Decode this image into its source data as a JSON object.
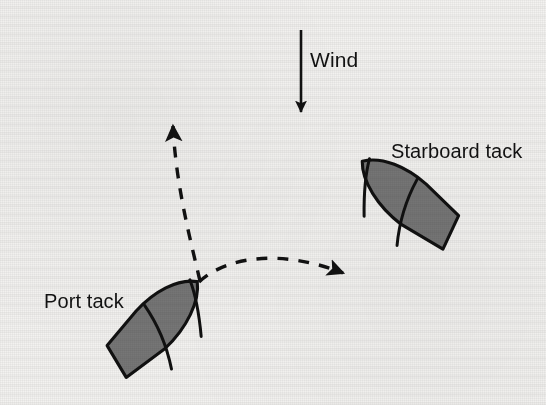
{
  "figure": {
    "background_color": "#f3f2f0",
    "ink_color": "#121212",
    "hull_fill_color": "#767676",
    "hull_outline_color": "#111111"
  },
  "labels": {
    "wind": "Wind",
    "starboard_tack": "Starboard tack",
    "port_tack": "Port tack"
  },
  "wind_arrow": {
    "direction": "down",
    "shaft_x": 301,
    "start_y": 30,
    "tip_y": 114
  },
  "boats": [
    {
      "name": "starboard-tack-boat",
      "label": "Starboard tack",
      "bow_x": 363,
      "bow_y": 164,
      "stern_x": 456,
      "stern_y": 239,
      "heading_deg": 39
    },
    {
      "name": "port-tack-boat",
      "label": "Port tack",
      "bow_x": 197,
      "bow_y": 283,
      "stern_x": 112,
      "stern_y": 369,
      "heading_deg": 135
    }
  ],
  "tack_paths": [
    {
      "name": "port-tack-heading-path",
      "style": "dashed",
      "start_x": 200,
      "start_y": 278,
      "end_x": 172,
      "end_y": 118,
      "arrowhead": "up-left"
    },
    {
      "name": "starboard-tack-heading-path",
      "style": "dashed",
      "start_x": 200,
      "start_y": 278,
      "end_x": 353,
      "end_y": 280,
      "arrowhead": "down-right"
    }
  ]
}
